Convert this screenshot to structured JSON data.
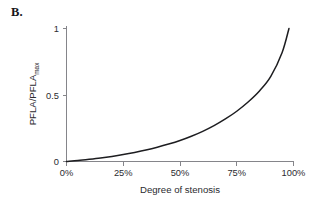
{
  "figure": {
    "panel_label": "B.",
    "background_color": "#ffffff",
    "curve_color": "#1d1d20",
    "axis_color": "#85858a",
    "text_color": "#2b2b2f"
  },
  "chart_data": {
    "type": "line",
    "title": "",
    "subtitle": "",
    "xlabel": "Degree of stenosis",
    "ylabel": "PFLA/PFLA",
    "ylabel_subscript": "max",
    "ylabel_full": "PFLA/PFLAmax",
    "xlim": [
      0,
      100
    ],
    "ylim": [
      0,
      1
    ],
    "xticks": [
      0,
      25,
      50,
      75,
      100
    ],
    "xticklabels": [
      "0%",
      "25%",
      "50%",
      "75%",
      "100%"
    ],
    "yticks": [
      0,
      0.5,
      1
    ],
    "yticklabels": [
      "0",
      "0.5",
      "1"
    ],
    "grid": false,
    "legend": null,
    "annotations": [],
    "series": [
      {
        "name": "PFLA ratio vs stenosis",
        "x": [
          0,
          5,
          10,
          15,
          20,
          25,
          30,
          35,
          40,
          45,
          50,
          55,
          60,
          65,
          70,
          75,
          80,
          85,
          90,
          95,
          98
        ],
        "y": [
          0.0,
          0.007,
          0.016,
          0.026,
          0.038,
          0.052,
          0.068,
          0.086,
          0.107,
          0.131,
          0.158,
          0.19,
          0.227,
          0.27,
          0.32,
          0.378,
          0.447,
          0.53,
          0.64,
          0.82,
          1.0
        ]
      }
    ]
  }
}
